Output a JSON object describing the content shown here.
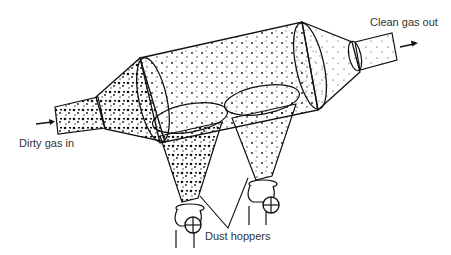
{
  "diagram": {
    "labels": {
      "inlet": "Dirty gas in",
      "outlet": "Clean  gas out",
      "hoppers": "Dust hoppers"
    },
    "colors": {
      "ink": "#111111",
      "background": "#ffffff"
    }
  }
}
